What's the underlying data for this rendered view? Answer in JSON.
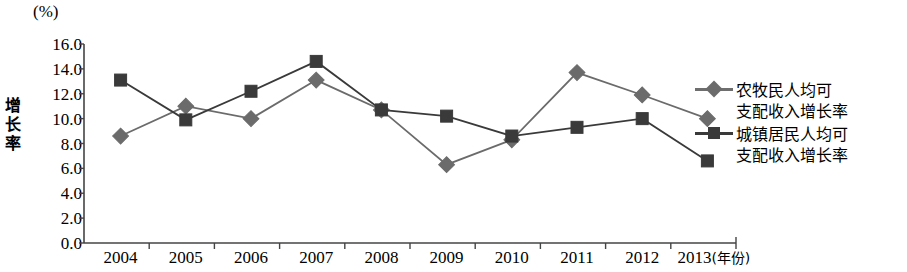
{
  "chart_data": {
    "type": "line",
    "title": "",
    "unit_label": "(%)",
    "ylabel": "增长率",
    "xlabel": "(年份)",
    "categories": [
      "2004",
      "2005",
      "2006",
      "2007",
      "2008",
      "2009",
      "2010",
      "2011",
      "2012",
      "2013"
    ],
    "ylim": [
      0.0,
      16.0
    ],
    "ytick_labels": [
      "16.0",
      "14.0",
      "12.0",
      "10.0",
      "8.0",
      "6.0",
      "4.0",
      "2.0",
      "0.0"
    ],
    "ytick_values": [
      16.0,
      14.0,
      12.0,
      10.0,
      8.0,
      6.0,
      4.0,
      2.0,
      0.0
    ],
    "grid": false,
    "legend_position": "right",
    "series": [
      {
        "name": "农牧民人均可支配收入增长率",
        "name_line1": "农牧民人均可",
        "name_line2": "支配收入增长率",
        "marker": "diamond",
        "color": "#6b6b6b",
        "values": [
          8.6,
          11.0,
          10.0,
          13.1,
          10.7,
          6.3,
          8.3,
          13.7,
          11.9,
          10.0
        ]
      },
      {
        "name": "城镇居民人均可支配收入增长率",
        "name_line1": "城镇居民人均可",
        "name_line2": "支配收入增长率",
        "marker": "square",
        "color": "#3a3a3a",
        "values": [
          13.1,
          9.9,
          12.2,
          14.6,
          10.7,
          10.2,
          8.6,
          9.3,
          10.0,
          6.6
        ]
      }
    ]
  }
}
